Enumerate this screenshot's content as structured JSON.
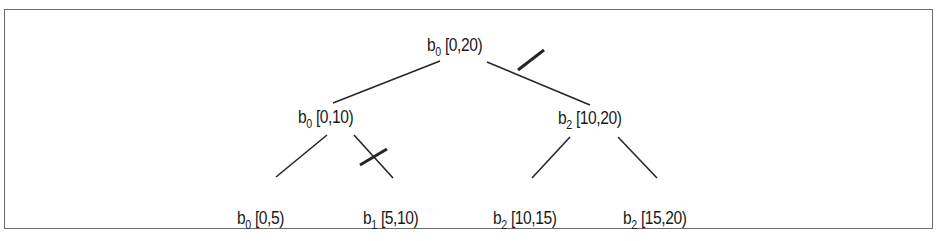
{
  "diagram": {
    "type": "binary-tree",
    "nodes": [
      {
        "id": "root",
        "base": "b",
        "sub": "0",
        "range": "[0,20)",
        "x": 427,
        "y": 35
      },
      {
        "id": "l",
        "base": "b",
        "sub": "0",
        "range": "[0,10)",
        "x": 298,
        "y": 107
      },
      {
        "id": "r",
        "base": "b",
        "sub": "2",
        "range": "[10,20)",
        "x": 558,
        "y": 108
      },
      {
        "id": "ll",
        "base": "b",
        "sub": "0",
        "range": "[0,5)",
        "x": 237,
        "y": 208
      },
      {
        "id": "lr",
        "base": "b",
        "sub": "1",
        "range": "[5,10)",
        "x": 363,
        "y": 208
      },
      {
        "id": "rl",
        "base": "b",
        "sub": "2",
        "range": "[10,15)",
        "x": 493,
        "y": 208
      },
      {
        "id": "rr",
        "base": "b",
        "sub": "2",
        "range": "[15,20)",
        "x": 623,
        "y": 208
      }
    ],
    "edges": [
      {
        "from": "root",
        "to": "l",
        "x1": 440,
        "y1": 61,
        "x2": 333,
        "y2": 103,
        "cut": false
      },
      {
        "from": "root",
        "to": "r",
        "x1": 487,
        "y1": 62,
        "x2": 590,
        "y2": 105,
        "cut": true,
        "cx1": 518,
        "cy1": 70,
        "cx2": 544,
        "cy2": 50
      },
      {
        "from": "l",
        "to": "ll",
        "x1": 327,
        "y1": 135,
        "x2": 276,
        "y2": 177,
        "cut": false
      },
      {
        "from": "l",
        "to": "lr",
        "x1": 354,
        "y1": 135,
        "x2": 393,
        "y2": 178,
        "cut": true,
        "cx1": 360,
        "cy1": 165,
        "cx2": 387,
        "cy2": 149
      },
      {
        "from": "r",
        "to": "rl",
        "x1": 570,
        "y1": 137,
        "x2": 532,
        "y2": 178,
        "cut": false
      },
      {
        "from": "r",
        "to": "rr",
        "x1": 618,
        "y1": 137,
        "x2": 657,
        "y2": 178,
        "cut": false
      }
    ],
    "colors": {
      "line": "#262626",
      "frame": "#6b6b6b",
      "text": "#1a1a1a"
    }
  }
}
